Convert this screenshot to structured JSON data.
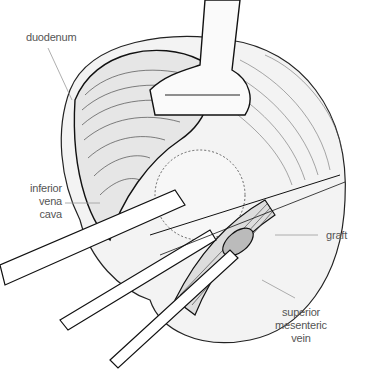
{
  "figure": {
    "labels": {
      "duodenum": "duodenum",
      "ivc_line1": "inferior",
      "ivc_line2": "vena",
      "ivc_line3": "cava",
      "graft": "graft",
      "smv_line1": "superior",
      "smv_line2": "mesenteric",
      "smv_line3": "vein"
    }
  }
}
